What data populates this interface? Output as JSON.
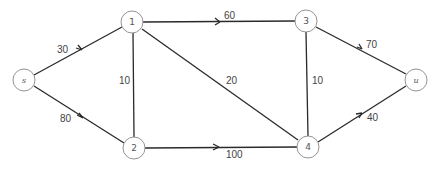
{
  "diagram": {
    "type": "network-flow-graph",
    "nodes": [
      {
        "id": "s",
        "label": "s",
        "x": 24,
        "y": 80,
        "italic": true
      },
      {
        "id": "1",
        "label": "1",
        "x": 132,
        "y": 22,
        "italic": false
      },
      {
        "id": "2",
        "label": "2",
        "x": 134,
        "y": 148,
        "italic": false
      },
      {
        "id": "3",
        "label": "3",
        "x": 306,
        "y": 21,
        "italic": false
      },
      {
        "id": "4",
        "label": "4",
        "x": 308,
        "y": 147,
        "italic": false
      },
      {
        "id": "u",
        "label": "u",
        "x": 416,
        "y": 80,
        "italic": true
      }
    ],
    "edges": [
      {
        "from": "s",
        "to": "1",
        "capacity": "30",
        "directed": true
      },
      {
        "from": "s",
        "to": "2",
        "capacity": "80",
        "directed": true
      },
      {
        "from": "1",
        "to": "2",
        "capacity": "10",
        "directed": false
      },
      {
        "from": "1",
        "to": "3",
        "capacity": "60",
        "directed": true
      },
      {
        "from": "1",
        "to": "4",
        "capacity": "20",
        "directed": false
      },
      {
        "from": "2",
        "to": "4",
        "capacity": "100",
        "directed": true
      },
      {
        "from": "3",
        "to": "4",
        "capacity": "10",
        "directed": false
      },
      {
        "from": "3",
        "to": "u",
        "capacity": "70",
        "directed": true
      },
      {
        "from": "4",
        "to": "u",
        "capacity": "40",
        "directed": true
      }
    ]
  }
}
